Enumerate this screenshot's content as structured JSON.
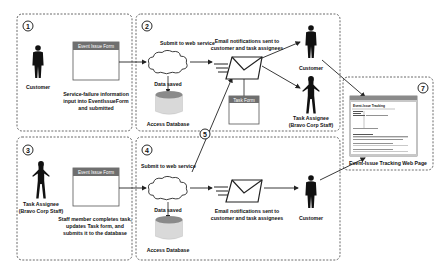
{
  "diagram": {
    "steps": [
      {
        "number": "1"
      },
      {
        "number": "2"
      },
      {
        "number": "3"
      },
      {
        "number": "4"
      },
      {
        "number": "5"
      },
      {
        "number": "7"
      }
    ],
    "step1": {
      "actor": "Customer",
      "form_title": "Event Issue Form",
      "description_lines": [
        "Service-failure information",
        "input into EventIssueForm",
        "and submitted"
      ]
    },
    "step2": {
      "submit_label": "Submit to web service",
      "data_saved": "Data saved",
      "database": "Access Database",
      "email_label_lines": [
        "Email notifications sent to",
        "customer and task assignees"
      ],
      "task_form_title": "Task Form",
      "customer": "Customer",
      "assignee_lines": [
        "Task Assignee",
        "(Bravo Corp Staff)"
      ]
    },
    "step3": {
      "actor_lines": [
        "Task Assignee",
        "(Bravo Corp Staff)"
      ],
      "form_title": "Event Issue Form",
      "description_lines": [
        "Staff member completes task,",
        "updates Task form, and",
        "submits it to the database"
      ]
    },
    "step4": {
      "submit_label": "Submit to web service",
      "data_saved": "Data saved",
      "database": "Access Database",
      "email_label_lines": [
        "Email notifications sent to",
        "customer and task assignees"
      ],
      "customer": "Customer"
    },
    "step7": {
      "page_title": "Event-Issue Tracking",
      "caption": "Event-Issue Tracking Web Page"
    },
    "colors": {
      "form_header": "#6f6f6f",
      "db_top": "#8a8a8a",
      "db_body": "#d9d9d9",
      "line": "#222222"
    }
  }
}
